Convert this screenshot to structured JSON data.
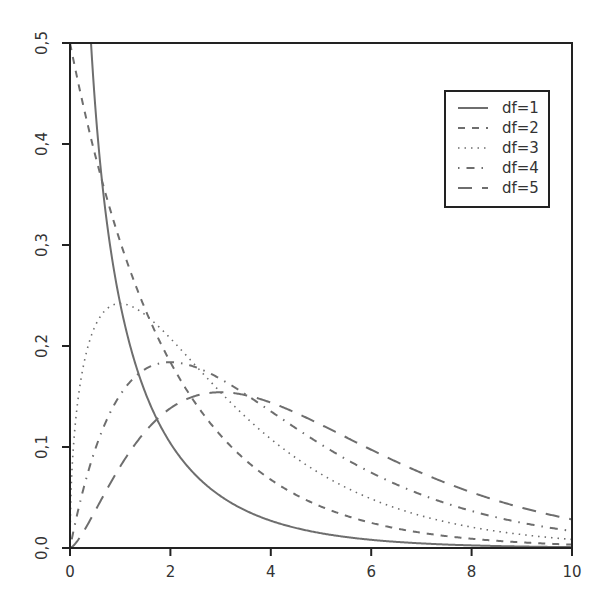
{
  "chart_data": {
    "type": "line",
    "title": "",
    "xlabel": "",
    "ylabel": "",
    "distribution": "chi-square density",
    "xlim": [
      0,
      10
    ],
    "ylim": [
      0,
      0.5
    ],
    "grid": false,
    "legend_position": "top-right (inside)",
    "x_ticks": [
      0,
      2,
      4,
      6,
      8,
      10
    ],
    "x_tick_labels": [
      "0",
      "2",
      "4",
      "6",
      "8",
      "10"
    ],
    "y_ticks": [
      0,
      0.1,
      0.2,
      0.3,
      0.4,
      0.5
    ],
    "y_tick_labels": [
      "0,0",
      "0,1",
      "0,2",
      "0,3",
      "0,4",
      "0,5"
    ],
    "line_color": "#6e6e6e",
    "series": [
      {
        "name": "df=1",
        "df": 1,
        "dash": "",
        "width": 2.0,
        "x": [
          0.4,
          0.5,
          1,
          1.5,
          2,
          3,
          4,
          5,
          6,
          8,
          10
        ],
        "values": [
          0.5,
          0.439,
          0.242,
          0.154,
          0.104,
          0.051,
          0.027,
          0.015,
          0.008,
          0.003,
          0.001
        ]
      },
      {
        "name": "df=2",
        "df": 2,
        "dash": "7,7",
        "width": 2.0,
        "x": [
          0,
          1,
          2,
          3,
          4,
          5,
          6,
          8,
          10
        ],
        "values": [
          0.5,
          0.303,
          0.184,
          0.112,
          0.068,
          0.041,
          0.025,
          0.009,
          0.003
        ]
      },
      {
        "name": "df=3",
        "df": 3,
        "dash": "1.5,5",
        "width": 1.6,
        "x": [
          0,
          0.5,
          1,
          2,
          3,
          4,
          5,
          6,
          8,
          10
        ],
        "values": [
          0,
          0.22,
          0.242,
          0.208,
          0.154,
          0.108,
          0.073,
          0.048,
          0.02,
          0.008
        ]
      },
      {
        "name": "df=4",
        "df": 4,
        "dash": "1.5,7,8,7",
        "width": 2.0,
        "x": [
          0,
          1,
          2,
          3,
          4,
          5,
          6,
          8,
          10
        ],
        "values": [
          0,
          0.152,
          0.184,
          0.167,
          0.135,
          0.103,
          0.075,
          0.037,
          0.017
        ]
      },
      {
        "name": "df=5",
        "df": 5,
        "dash": "14,10",
        "width": 2.0,
        "x": [
          0,
          1,
          2,
          3,
          4,
          5,
          6,
          8,
          10
        ],
        "values": [
          0,
          0.081,
          0.138,
          0.154,
          0.144,
          0.122,
          0.097,
          0.055,
          0.028
        ]
      }
    ]
  },
  "legend": {
    "items": [
      "df=1",
      "df=2",
      "df=3",
      "df=4",
      "df=5"
    ]
  }
}
